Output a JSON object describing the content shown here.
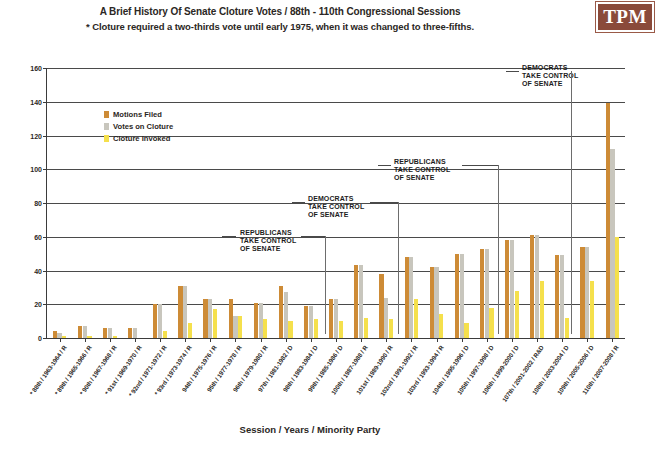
{
  "header": {
    "title": "A Brief History Of Senate Cloture Votes / 88th - 110th Congressional Sessions",
    "subtitle": "* Cloture required a two-thirds vote until early 1975, when it was changed to three-fifths.",
    "logo": "TPM"
  },
  "legend": {
    "items": [
      {
        "label": "Motions Filed",
        "color": "#cd8b36"
      },
      {
        "label": "Votes on Cloture",
        "color": "#c8c6bd"
      },
      {
        "label": "Cloture Invoked",
        "color": "#f5e04c"
      }
    ]
  },
  "annotations": [
    {
      "id": "ann-rep-1",
      "text": "REPUBLICANS\nTAKE CONTROL\nOF SENATE"
    },
    {
      "id": "ann-dem-1",
      "text": "DEMOCRATS\nTAKE CONTROL\nOF SENATE"
    },
    {
      "id": "ann-rep-2",
      "text": "REPUBLICANS\nTAKE CONTROL\nOF SENATE"
    },
    {
      "id": "ann-dem-2",
      "text": "DEMOCRATS\nTAKE CONTROL\nOF SENATE"
    }
  ],
  "chart_data": {
    "type": "bar",
    "title": "A Brief History Of Senate Cloture Votes / 88th - 110th Congressional Sessions",
    "subtitle": "* Cloture required a two-thirds vote until early 1975, when it was changed to three-fifths.",
    "xlabel": "Session / Years / Minority Party",
    "ylabel": "",
    "ylim": [
      0,
      160
    ],
    "yticks": [
      0,
      20,
      40,
      60,
      80,
      100,
      120,
      140,
      160
    ],
    "grid": true,
    "legend_position": "upper-left-inside",
    "categories": [
      "* 88th / 1963-1964 / R",
      "* 89th / 1965-1966 / R",
      "* 90th / 1967-1968 / R",
      "* 91st / 1969-1970 / R",
      "* 92nd / 1971-1972 / R",
      "* 93rd / 1973-1974 / R",
      "94th / 1975-1976 / R",
      "95th / 1977-1978 / R",
      "96th / 1979-1980 / R",
      "97th / 1981-1982 / D",
      "98th / 1983-1984 / D",
      "99th / 1985-1986 / D",
      "100th / 1987-1988 / R",
      "101st / 1989-1990 / R",
      "102nd / 1991-1992 / R",
      "103rd / 1993-1994 / R",
      "104th / 1995-1996 / D",
      "105th / 1997-1998 / D",
      "106th / 1999-2000 / D",
      "107th / 2001-2002 / R&D",
      "108th / 2003-2004 / D",
      "109th / 2005-2006 / D",
      "110th / 2007-2008 / R"
    ],
    "series": [
      {
        "name": "Motions Filed",
        "color": "#cd8b36",
        "values": [
          4,
          7,
          6,
          6,
          20,
          31,
          23,
          23,
          21,
          31,
          19,
          23,
          43,
          38,
          48,
          42,
          50,
          53,
          58,
          61,
          49,
          54,
          139
        ]
      },
      {
        "name": "Votes on Cloture",
        "color": "#c8c6bd",
        "values": [
          3,
          7,
          6,
          6,
          20,
          31,
          23,
          13,
          21,
          27,
          19,
          23,
          43,
          24,
          48,
          42,
          50,
          53,
          58,
          61,
          49,
          54,
          112
        ]
      },
      {
        "name": "Cloture Invoked",
        "color": "#f5e04c",
        "values": [
          1,
          1,
          1,
          0,
          4,
          9,
          17,
          13,
          11,
          10,
          11,
          10,
          12,
          11,
          23,
          14,
          9,
          18,
          28,
          34,
          12,
          34,
          60
        ]
      }
    ],
    "note": "Bar heights read from gridlines; early sessions (88th-91st) are near zero."
  }
}
